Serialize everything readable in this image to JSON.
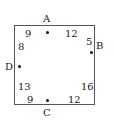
{
  "diagram": {
    "points": {
      "A": {
        "label": "A",
        "side": "top"
      },
      "B": {
        "label": "B",
        "side": "right"
      },
      "C": {
        "label": "C",
        "side": "bottom"
      },
      "D": {
        "label": "D",
        "side": "left"
      }
    },
    "segments": {
      "top_left": "9",
      "top_right": "12",
      "right_top": "5",
      "right_bottom": "16",
      "bottom_right": "12",
      "bottom_left": "9",
      "left_bottom": "13",
      "left_top": "8"
    }
  }
}
